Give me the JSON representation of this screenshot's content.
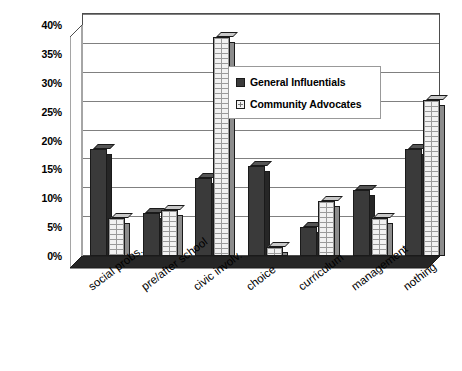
{
  "chart_data": {
    "type": "bar",
    "title": "",
    "subtitle": "",
    "xlabel": "",
    "ylabel": "",
    "ylim": [
      0,
      40
    ],
    "ytick_labels": [
      "0%",
      "5%",
      "10%",
      "15%",
      "20%",
      "25%",
      "30%",
      "35%",
      "40%"
    ],
    "ytick_values": [
      0,
      5,
      10,
      15,
      20,
      25,
      30,
      35,
      40
    ],
    "grid": true,
    "legend_position": "inside-top-right",
    "style": "3d-column",
    "categories": [
      "social probs.",
      "pre/after school",
      "civic involv.",
      "choice",
      "curriculum",
      "management",
      "nothing"
    ],
    "series": [
      {
        "name": "General Influentials",
        "color": "#3a3a3a",
        "fill": "solid-dark",
        "values": [
          18.5,
          7.5,
          13.5,
          15.5,
          5,
          11.5,
          18.5
        ]
      },
      {
        "name": "Community Advocates",
        "color": "#f2f2f2",
        "fill": "brick-hatch",
        "values": [
          6.5,
          8,
          38,
          1.5,
          9.5,
          6.5,
          27
        ]
      }
    ]
  },
  "legend": {
    "items": [
      {
        "label": "General Influentials",
        "swatch": "solid-dark-square-icon"
      },
      {
        "label": "Community Advocates",
        "swatch": "hatched-light-square-icon"
      }
    ]
  }
}
